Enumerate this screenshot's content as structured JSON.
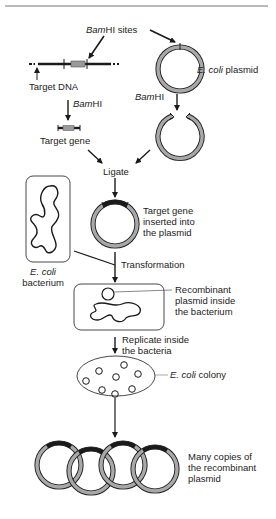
{
  "diagram": {
    "labels": {
      "bamhi_sites_italic": "Bam",
      "bamhi_sites_rest": "HI sites",
      "target_dna": "Target DNA",
      "bamhi_left_italic": "Bam",
      "bamhi_left_rest": "HI",
      "ecoli_plasmid_italic": "E. coli",
      "ecoli_plasmid_rest": " plasmid",
      "bamhi_right_italic": "Bam",
      "bamhi_right_rest": "HI",
      "target_gene": "Target gene",
      "ligate": "Ligate",
      "target_gene_inserted": "Target gene\ninserted into\nthe plasmid",
      "ecoli_bacterium_italic": "E. coli",
      "ecoli_bacterium_rest": "bacterium",
      "transformation": "Transformation",
      "recombinant_plasmid_inside": "Recombinant\nplasmid inside\nthe bacterium",
      "replicate_inside": "Replicate inside\nthe bacteria",
      "ecoli_colony_italic": "E. coli",
      "ecoli_colony_rest": " colony",
      "many_copies": "Many copies of\nthe recombinant\nplasmid"
    },
    "colors": {
      "line": "#1a1a1a",
      "plasmid_fill": "#a8a8a8",
      "gene_fill": "#9a9a9a"
    }
  }
}
